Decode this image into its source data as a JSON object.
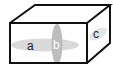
{
  "diagram": {
    "type": "rectangular-prism",
    "labels": {
      "a": "a",
      "b": "b",
      "c": "c"
    },
    "colors": {
      "edge": "#111111",
      "ellipse_fill": "#d6d6d6",
      "ellipse_b_fill": "#bfbfbf",
      "label": "#222222",
      "label_b": "#ffffff",
      "background": "#ffffff"
    }
  }
}
